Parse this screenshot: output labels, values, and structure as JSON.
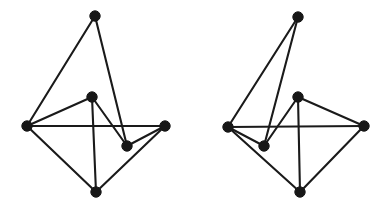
{
  "figure": {
    "title": "",
    "caption": "",
    "background_color": "#ffffff",
    "edge_color": "#1a1a1a",
    "vertex_color": "#171717",
    "edge_width": 2.1,
    "vertex_radius": 5.2,
    "width": 387,
    "height": 213
  },
  "graphs": [
    {
      "name": "left-graph",
      "label": "",
      "vertex_count": 6,
      "edge_count": 9,
      "vertices": [
        {
          "id": "L-top",
          "name": "vertex-top",
          "x": 95,
          "y": 16,
          "label": ""
        },
        {
          "id": "L-left",
          "name": "vertex-left",
          "x": 27,
          "y": 126,
          "label": ""
        },
        {
          "id": "L-right",
          "name": "vertex-right",
          "x": 165,
          "y": 126,
          "label": ""
        },
        {
          "id": "L-bottom",
          "name": "vertex-bottom",
          "x": 96,
          "y": 192,
          "label": ""
        },
        {
          "id": "L-mid-upper",
          "name": "vertex-mid-upper",
          "x": 92,
          "y": 97,
          "label": ""
        },
        {
          "id": "L-mid-lower",
          "name": "vertex-mid-lower",
          "x": 127,
          "y": 146,
          "label": ""
        }
      ],
      "edges": [
        {
          "from": "L-top",
          "to": "L-left",
          "name": "edge-top-left"
        },
        {
          "from": "L-top",
          "to": "L-mid-lower",
          "name": "edge-top-midlower"
        },
        {
          "from": "L-left",
          "to": "L-right",
          "name": "edge-left-right"
        },
        {
          "from": "L-left",
          "to": "L-bottom",
          "name": "edge-left-bottom"
        },
        {
          "from": "L-right",
          "to": "L-bottom",
          "name": "edge-right-bottom"
        },
        {
          "from": "L-right",
          "to": "L-mid-lower",
          "name": "edge-right-midlower"
        },
        {
          "from": "L-mid-upper",
          "to": "L-mid-lower",
          "name": "edge-midupper-midlower"
        },
        {
          "from": "L-mid-upper",
          "to": "L-bottom",
          "name": "edge-midupper-bottom"
        },
        {
          "from": "L-mid-upper",
          "to": "L-left",
          "name": "edge-midupper-left-overlap"
        }
      ]
    },
    {
      "name": "right-graph",
      "label": "",
      "vertex_count": 6,
      "edge_count": 9,
      "vertices": [
        {
          "id": "R-top",
          "name": "vertex-top",
          "x": 298,
          "y": 17,
          "label": ""
        },
        {
          "id": "R-left",
          "name": "vertex-left",
          "x": 228,
          "y": 127,
          "label": ""
        },
        {
          "id": "R-right",
          "name": "vertex-right",
          "x": 364,
          "y": 126,
          "label": ""
        },
        {
          "id": "R-bottom",
          "name": "vertex-bottom",
          "x": 300,
          "y": 192,
          "label": ""
        },
        {
          "id": "R-mid-upper",
          "name": "vertex-mid-upper",
          "x": 298,
          "y": 97,
          "label": ""
        },
        {
          "id": "R-mid-lower",
          "name": "vertex-mid-lower",
          "x": 264,
          "y": 146,
          "label": ""
        }
      ],
      "edges": [
        {
          "from": "R-top",
          "to": "R-left",
          "name": "edge-top-left"
        },
        {
          "from": "R-top",
          "to": "R-mid-lower",
          "name": "edge-top-midlower"
        },
        {
          "from": "R-left",
          "to": "R-right",
          "name": "edge-left-right"
        },
        {
          "from": "R-left",
          "to": "R-bottom",
          "name": "edge-left-bottom"
        },
        {
          "from": "R-right",
          "to": "R-bottom",
          "name": "edge-right-bottom"
        },
        {
          "from": "R-left",
          "to": "R-mid-lower",
          "name": "edge-left-midlower"
        },
        {
          "from": "R-mid-upper",
          "to": "R-mid-lower",
          "name": "edge-midupper-midlower"
        },
        {
          "from": "R-mid-upper",
          "to": "R-bottom",
          "name": "edge-midupper-bottom"
        },
        {
          "from": "R-mid-upper",
          "to": "R-right",
          "name": "edge-midupper-right-overlap"
        }
      ]
    }
  ]
}
